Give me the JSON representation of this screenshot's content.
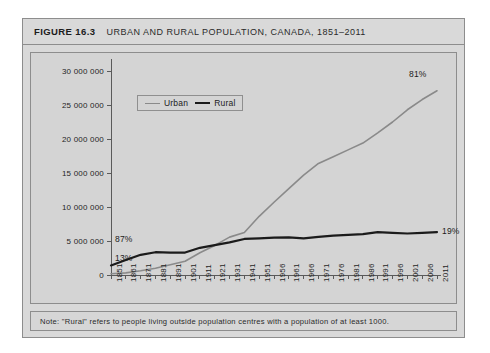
{
  "figure": {
    "number_label": "FIGURE 16.3",
    "title": "URBAN AND RURAL POPULATION, CANADA, 1851–2011",
    "footnote": "Note: \"Rural\" refers to people living outside population centres with a population of at least 1000."
  },
  "colors": {
    "urban_line": "#8a8a8a",
    "rural_line": "#1b1b1b",
    "plot_background": "#d4d4d4",
    "card_background": "#d9d9d9",
    "border": "#8d8d8d",
    "axis": "#5a5a5a",
    "text": "#1b1b1b"
  },
  "chart_data": {
    "type": "line",
    "title": "URBAN AND RURAL POPULATION, CANADA, 1851–2011",
    "xlabel": "",
    "ylabel": "",
    "grid": false,
    "legend_position": "top-left-inside",
    "xlim": [
      1851,
      2011
    ],
    "ylim": [
      0,
      30000000
    ],
    "ytick_labels": [
      "30 000 000",
      "25 000 000",
      "20 000 000",
      "15 000 000",
      "10 000 000",
      "5 000 000",
      "0"
    ],
    "ytick_values": [
      30000000,
      25000000,
      20000000,
      15000000,
      10000000,
      5000000,
      0
    ],
    "categories": [
      "1851",
      "1861",
      "1871",
      "1881",
      "1891",
      "1901",
      "1911",
      "1921",
      "1931",
      "1941",
      "1951",
      "1956",
      "1961",
      "1966",
      "1971",
      "1976",
      "1981",
      "1986",
      "1991",
      "1996",
      "2001",
      "2006",
      "2011"
    ],
    "series": [
      {
        "name": "Urban",
        "color": "#8a8a8a",
        "values": [
          187000,
          310000,
          620000,
          990000,
          1500000,
          2020000,
          3270000,
          4350000,
          5570000,
          6250000,
          8630000,
          10700000,
          12700000,
          14700000,
          16400000,
          17400000,
          18400000,
          19400000,
          20900000,
          22500000,
          24300000,
          25800000,
          27100000
        ]
      },
      {
        "name": "Rural",
        "color": "#1b1b1b",
        "values": [
          1400000,
          2200000,
          2970000,
          3350000,
          3300000,
          3300000,
          4000000,
          4400000,
          4800000,
          5300000,
          5400000,
          5500000,
          5540000,
          5400000,
          5600000,
          5800000,
          5900000,
          6000000,
          6300000,
          6200000,
          6100000,
          6200000,
          6300000
        ]
      }
    ],
    "annotations": [
      {
        "text": "87%",
        "series": "Rural",
        "at_category": "1851",
        "placement": "above-left-start"
      },
      {
        "text": "13%",
        "series": "Urban",
        "at_category": "1851",
        "placement": "below-left-start"
      },
      {
        "text": "81%",
        "series": "Urban",
        "at_category": "2011",
        "placement": "above-right-end"
      },
      {
        "text": "19%",
        "series": "Rural",
        "at_category": "2011",
        "placement": "right-end"
      }
    ]
  }
}
